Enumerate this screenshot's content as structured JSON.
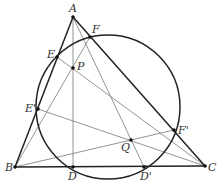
{
  "diagram": {
    "type": "geometry",
    "circle": {
      "cx": 108,
      "cy": 107,
      "r": 72
    },
    "points": [
      {
        "name": "A",
        "x": 73,
        "y": 17,
        "lx": 69,
        "ly": 12
      },
      {
        "name": "F",
        "x": 90,
        "y": 37,
        "lx": 92,
        "ly": 33
      },
      {
        "name": "E",
        "x": 57,
        "y": 57,
        "lx": 47,
        "ly": 58
      },
      {
        "name": "P",
        "x": 73,
        "y": 68,
        "lx": 77,
        "ly": 70
      },
      {
        "name": "E'",
        "x": 38,
        "y": 109,
        "lx": 25,
        "ly": 112
      },
      {
        "name": "B",
        "x": 15,
        "y": 167,
        "lx": 5,
        "ly": 171
      },
      {
        "name": "D",
        "x": 73,
        "y": 167,
        "lx": 68,
        "ly": 180
      },
      {
        "name": "D'",
        "x": 144,
        "y": 167,
        "lx": 140,
        "ly": 180
      },
      {
        "name": "Q",
        "x": 131,
        "y": 140,
        "lx": 121,
        "ly": 151
      },
      {
        "name": "F'",
        "x": 174,
        "y": 130,
        "lx": 178,
        "ly": 134
      },
      {
        "name": "C",
        "x": 205,
        "y": 166,
        "lx": 208,
        "ly": 171
      }
    ],
    "thick_segments": [
      [
        "A",
        "B"
      ],
      [
        "B",
        "C"
      ],
      [
        "C",
        "A"
      ]
    ],
    "thin_segments": [
      [
        "A",
        "D"
      ],
      [
        "A",
        "D'"
      ],
      [
        "E",
        "C"
      ],
      [
        "B",
        "F"
      ],
      [
        "E'",
        "C"
      ],
      [
        "B",
        "F'"
      ]
    ]
  }
}
